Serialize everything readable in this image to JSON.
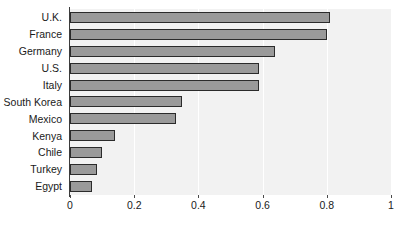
{
  "chart_data": {
    "type": "bar",
    "orientation": "horizontal",
    "title": "",
    "subtitle": "",
    "xlabel": "",
    "ylabel": "",
    "xlim": [
      0,
      1
    ],
    "grid": true,
    "legend": false,
    "legend_position": "none",
    "categories": [
      "U.K.",
      "France",
      "Germany",
      "U.S.",
      "Italy",
      "South Korea",
      "Mexico",
      "Kenya",
      "Chile",
      "Turkey",
      "Egypt"
    ],
    "values": [
      0.81,
      0.8,
      0.64,
      0.59,
      0.59,
      0.35,
      0.33,
      0.14,
      0.1,
      0.085,
      0.07
    ],
    "xticks": [
      0,
      0.2,
      0.4,
      0.6,
      0.8,
      1
    ],
    "xtick_labels": [
      "0",
      "0.2",
      "0.4",
      "0.6",
      "0.8",
      "1"
    ],
    "colors": {
      "bar_fill": "#9a9a9a",
      "bar_edge": "#2b2b2b",
      "plot_background": "#f2f2f2",
      "gridline": "#ffffff",
      "axis_line": "#3b3b3b",
      "text": "#1a1a1a",
      "page_background": "#ffffff"
    }
  }
}
